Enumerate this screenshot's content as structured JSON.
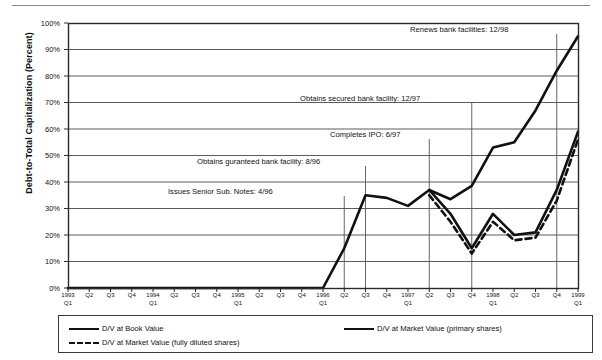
{
  "chart_data": {
    "type": "line",
    "title": "",
    "xlabel": "",
    "ylabel": "Debt-to-Total Capitalization (Percent)",
    "ylim": [
      0,
      100
    ],
    "ytick_labels": [
      "0%",
      "10%",
      "20%",
      "30%",
      "40%",
      "50%",
      "60%",
      "70%",
      "80%",
      "90%",
      "100%"
    ],
    "ytick_values": [
      0,
      10,
      20,
      30,
      40,
      50,
      60,
      70,
      80,
      90,
      100
    ],
    "grid": true,
    "legend_position": "bottom",
    "categories": [
      "1993 Q1",
      "Q2",
      "Q3",
      "Q4",
      "1994 Q1",
      "Q2",
      "Q3",
      "Q4",
      "1995 Q1",
      "Q2",
      "Q3",
      "Q4",
      "1996 Q1",
      "Q2",
      "Q3",
      "Q4",
      "1997 Q1",
      "Q2",
      "Q3",
      "Q4",
      "1998 Q1",
      "Q2",
      "Q3",
      "Q4",
      "1999 Q1"
    ],
    "xtick_year_labels": [
      {
        "index": 0,
        "year": "1993",
        "quarter": "Q1"
      },
      {
        "index": 1,
        "year": "",
        "quarter": "Q2"
      },
      {
        "index": 2,
        "year": "",
        "quarter": "Q3"
      },
      {
        "index": 3,
        "year": "",
        "quarter": "Q4"
      },
      {
        "index": 4,
        "year": "1994",
        "quarter": "Q1"
      },
      {
        "index": 5,
        "year": "",
        "quarter": "Q2"
      },
      {
        "index": 6,
        "year": "",
        "quarter": "Q3"
      },
      {
        "index": 7,
        "year": "",
        "quarter": "Q4"
      },
      {
        "index": 8,
        "year": "1995",
        "quarter": "Q1"
      },
      {
        "index": 9,
        "year": "",
        "quarter": "Q2"
      },
      {
        "index": 10,
        "year": "",
        "quarter": "Q3"
      },
      {
        "index": 11,
        "year": "",
        "quarter": "Q4"
      },
      {
        "index": 12,
        "year": "1996",
        "quarter": "Q1"
      },
      {
        "index": 13,
        "year": "",
        "quarter": "Q2"
      },
      {
        "index": 14,
        "year": "",
        "quarter": "Q3"
      },
      {
        "index": 15,
        "year": "",
        "quarter": "Q4"
      },
      {
        "index": 16,
        "year": "1997",
        "quarter": "Q1"
      },
      {
        "index": 17,
        "year": "",
        "quarter": "Q2"
      },
      {
        "index": 18,
        "year": "",
        "quarter": "Q3"
      },
      {
        "index": 19,
        "year": "",
        "quarter": "Q4"
      },
      {
        "index": 20,
        "year": "1998",
        "quarter": "Q1"
      },
      {
        "index": 21,
        "year": "",
        "quarter": "Q2"
      },
      {
        "index": 22,
        "year": "",
        "quarter": "Q3"
      },
      {
        "index": 23,
        "year": "",
        "quarter": "Q4"
      },
      {
        "index": 24,
        "year": "1999",
        "quarter": "Q1"
      }
    ],
    "series": [
      {
        "name": "D/V at Book Value",
        "style": "solid",
        "color": "#111111",
        "values": [
          0,
          0,
          0,
          0,
          0,
          0,
          0,
          0,
          0,
          0,
          0,
          0,
          0,
          15,
          35,
          34,
          31,
          37,
          33.5,
          38.5,
          53,
          55,
          67,
          82,
          95
        ]
      },
      {
        "name": "D/V at Market Value (primary shares)",
        "style": "solid",
        "color": "#111111",
        "values": [
          null,
          null,
          null,
          null,
          null,
          null,
          null,
          null,
          null,
          null,
          null,
          null,
          null,
          null,
          null,
          null,
          null,
          37,
          28,
          15,
          28,
          20,
          21,
          37,
          59
        ]
      },
      {
        "name": "D/V at Market Value (fully diluted shares)",
        "style": "dashed",
        "color": "#111111",
        "values": [
          null,
          null,
          null,
          null,
          null,
          null,
          null,
          null,
          null,
          null,
          null,
          null,
          null,
          null,
          null,
          null,
          null,
          35,
          25,
          13,
          25,
          18,
          19,
          33,
          56
        ]
      }
    ],
    "annotations": [
      {
        "text": "Renews bank facilities: 12/98",
        "x_index": 23,
        "value_at": null,
        "label_x": 410,
        "label_y": 30
      },
      {
        "text": "Obtains secured bank facility: 12/97",
        "x_index": 19,
        "value_at": null,
        "label_x": 300,
        "label_y": 99
      },
      {
        "text": "Completes IPO: 6/97",
        "x_index": 17,
        "value_at": null,
        "label_x": 330,
        "label_y": 135
      },
      {
        "text": "Obtains guranteed bank facility: 8/96",
        "x_index": 14,
        "value_at": null,
        "label_x": 197,
        "label_y": 162
      },
      {
        "text": "Issues Senior Sub. Notes: 4/96",
        "x_index": 13,
        "value_at": null,
        "label_x": 168,
        "label_y": 192
      }
    ]
  },
  "legend": {
    "entries": [
      {
        "label": "D/V at Book Value",
        "style": "solid"
      },
      {
        "label": "D/V at Market Value (primary shares)",
        "style": "solid"
      },
      {
        "label": "D/V at Market Value (fully diluted shares)",
        "style": "dashed"
      }
    ]
  }
}
